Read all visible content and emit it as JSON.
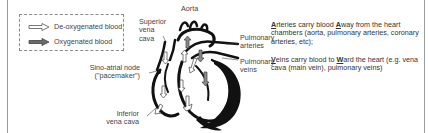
{
  "legend": {
    "items": [
      {
        "label": "De-oxygenated blood",
        "icon": "hollow-arrow-icon",
        "fill": "#ffffff",
        "stroke": "#555555"
      },
      {
        "label": "Oxygenated blood",
        "icon": "filled-arrow-icon",
        "fill": "#6b6b6b",
        "stroke": "#444444"
      }
    ]
  },
  "labels": {
    "aorta": "Aorta",
    "superior_vena_cava": [
      "Superior",
      "vena",
      "cava"
    ],
    "pulmonary_arteries": [
      "Pulmonary",
      "arteries"
    ],
    "pulmonary_veins": [
      "Pulmonary",
      "veins"
    ],
    "sino_atrial_node": [
      "Sino-atrial node",
      "(\"pacemaker\")"
    ],
    "inferior_vena_cava": [
      "Inferior",
      "vena cava"
    ]
  },
  "notes": {
    "arteries": {
      "first_letter": "A",
      "part1": "rteries carry blood ",
      "key_letter": "A",
      "part2": "way from the heart chambers (aorta, pulmonary arteries, coronary arteries, etc);"
    },
    "veins": {
      "first_letter": "V",
      "part1": "eins carry blood to ",
      "key_letter": "W",
      "part2": "ard the heart (e.g. vena cava (main vein), pulmonary veins)"
    }
  },
  "colors": {
    "heart_outline": "#111111",
    "frame": "#9a9a9a",
    "text": "#444444"
  }
}
